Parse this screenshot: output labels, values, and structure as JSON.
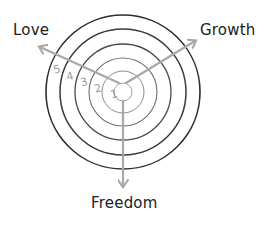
{
  "diagram": {
    "title": "",
    "axes": [
      {
        "label": "Love",
        "direction": "upper-left"
      },
      {
        "label": "Growth",
        "direction": "upper-right"
      },
      {
        "label": "Freedom",
        "direction": "down"
      }
    ],
    "rings": {
      "count": 5,
      "labels": [
        "1",
        "2",
        "3",
        "4",
        "5"
      ]
    },
    "colors": {
      "ring_outer": "#2e2e2e",
      "ring_inner": "#9a9a9a",
      "arrow": "#a8a8a8",
      "scale_numbers": "#9a9a9a",
      "label_text": "#222222"
    }
  }
}
